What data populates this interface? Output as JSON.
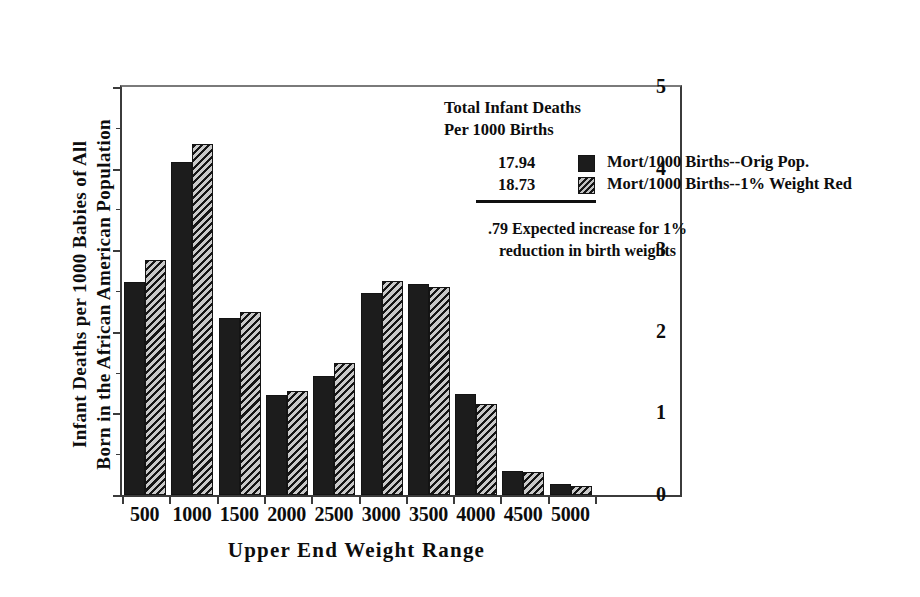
{
  "chart_data": {
    "type": "bar",
    "title": "",
    "xlabel": "Upper End Weight Range",
    "ylabel": "Infant Deaths per 1000 Babies of All\nBorn in the African American Population",
    "categories": [
      "500",
      "1000",
      "1500",
      "2000",
      "2500",
      "3000",
      "3500",
      "4000",
      "4500",
      "5000"
    ],
    "series": [
      {
        "name": "Mort/1000 Births--Orig Pop.",
        "style": "solid",
        "color": "#1c1c1c",
        "values": [
          2.61,
          4.08,
          2.17,
          1.22,
          1.46,
          2.47,
          2.58,
          1.24,
          0.29,
          0.14
        ]
      },
      {
        "name": "Mort/1000 Births--1% Weight Red",
        "style": "hatched",
        "color": "#6f6f6f",
        "values": [
          2.88,
          4.3,
          2.24,
          1.27,
          1.62,
          2.62,
          2.55,
          1.12,
          0.28,
          0.11
        ]
      }
    ],
    "ylim": [
      0,
      5
    ],
    "yticks": [
      0,
      1,
      2,
      3,
      4,
      5
    ],
    "ytick_labels": [
      "0",
      "1",
      "2",
      "3",
      "4",
      "5"
    ],
    "yminor_ticks": [
      0.5,
      1.5,
      2.5,
      3.5,
      4.5
    ],
    "grid": false,
    "legend_position": "inside-upper-right"
  },
  "annotation": {
    "heading": "Total Infant Deaths\nPer 1000 Births",
    "value_original": "17.94",
    "value_reduced": "18.73",
    "difference_note": ".79 Expected increase for 1%\nreduction in birth weights"
  },
  "legend": {
    "entries": [
      {
        "label": "Mort/1000 Births--Orig Pop."
      },
      {
        "label": "Mort/1000 Births--1% Weight Red"
      }
    ]
  }
}
